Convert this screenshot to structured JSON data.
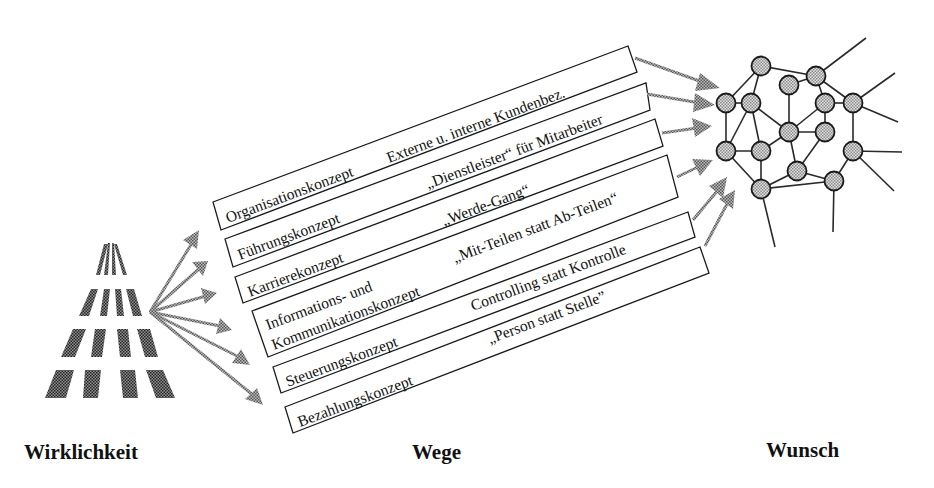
{
  "headings": {
    "left": "Wirklichkeit",
    "middle": "Wege",
    "right": "Wunsch"
  },
  "concepts": [
    {
      "name": "Organisationskonzept",
      "name_line2": "",
      "motto": "Externe u. interne Kundenbez."
    },
    {
      "name": "Führungskonzept",
      "name_line2": "",
      "motto": "„Dienstleister“ für Mitarbeiter"
    },
    {
      "name": "Karrierekonzept",
      "name_line2": "",
      "motto": "„Werde-Gang“"
    },
    {
      "name": "Informations- und",
      "name_line2": "Kommunikationskonzept",
      "motto": "„Mit-Teilen statt Ab-Teilen“"
    },
    {
      "name": "Steuerungskonzept",
      "name_line2": "",
      "motto": "Controlling statt Kontrolle"
    },
    {
      "name": "Bezahlungskonzept",
      "name_line2": "",
      "motto": "„Person statt Stelle”"
    }
  ],
  "icons": {
    "reality": "striped-pyramid-icon",
    "wish": "network-graph-icon"
  },
  "colors": {
    "ink": "#111111",
    "pattern": "#555555",
    "background": "#ffffff"
  }
}
